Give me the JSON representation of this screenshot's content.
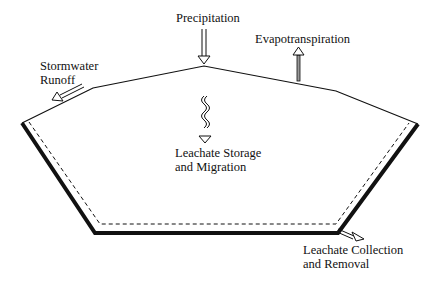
{
  "diagram": {
    "type": "landfill water balance cross-section",
    "labels": {
      "precipitation": "Precipitation",
      "evapotranspiration": "Evapotranspiration",
      "stormwater_line1": "Stormwater",
      "stormwater_line2": "Runoff",
      "storage_line1": "Leachate Storage",
      "storage_line2": "and Migration",
      "collection_line1": "Leachate Collection",
      "collection_line2": "and Removal"
    },
    "colors": {
      "line": "#111111",
      "background": "#ffffff"
    }
  }
}
